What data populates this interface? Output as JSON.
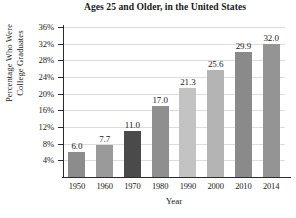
{
  "chart_data": {
    "type": "bar",
    "title": "Ages 25 and Older, in the United States",
    "xlabel": "Year",
    "ylabel_line1": "Percentage Who Were",
    "ylabel_line2": "College Graduates",
    "categories": [
      "1950",
      "1960",
      "1970",
      "1980",
      "1990",
      "2000",
      "2010",
      "2014"
    ],
    "values": [
      6.0,
      7.7,
      11.0,
      17.0,
      21.3,
      25.6,
      29.9,
      32.0
    ],
    "value_labels": [
      "6.0",
      "7.7",
      "11.0",
      "17.0",
      "21.3",
      "25.6",
      "29.9",
      "32.0"
    ],
    "bar_colors": [
      "#8c8c8c",
      "#9a9a9a",
      "#4a4a4a",
      "#8f8f8f",
      "#c3c3c3",
      "#b4b4b4",
      "#8a8a8a",
      "#949494"
    ],
    "ylim": [
      0,
      36
    ],
    "ytick_values": [
      4,
      8,
      12,
      16,
      20,
      24,
      28,
      32,
      36
    ],
    "ytick_labels": [
      "4%",
      "8%",
      "12%",
      "16%",
      "20%",
      "24%",
      "28%",
      "32%",
      "36%"
    ],
    "grid": true,
    "legend": "none",
    "axis_color": "#2b2b2b",
    "grid_color": "#dcdcdc"
  }
}
